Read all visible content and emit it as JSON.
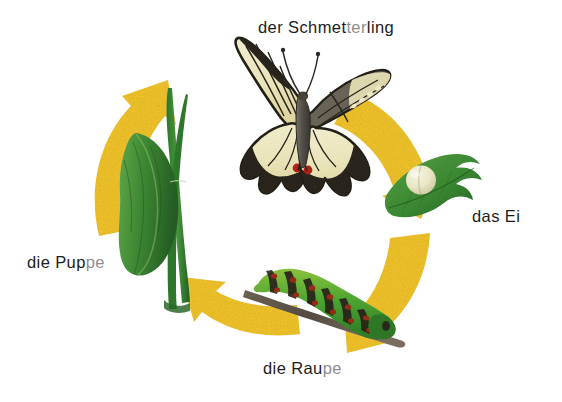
{
  "figure": {
    "title_text": "Schmetterling Lebenszyklus (Butterfly life cycle)",
    "background_color": "#ffffff",
    "arrow_color": "#f2c52a",
    "arrow_color_light": "#f7da63",
    "leaf_green": "#3f8a33",
    "leaf_green_dark": "#27662a",
    "text_color": "#1c1c1c",
    "text_color_dim": "#8e8e90"
  },
  "labels": {
    "butterfly": {
      "lead": "der Schmet",
      "dim": "ter",
      "tail": "ling",
      "full": "der Schmetterling"
    },
    "egg": {
      "lead": "das Ei",
      "dim": "",
      "tail": "",
      "full": "das Ei"
    },
    "pupa": {
      "lead": "die Pup",
      "dim": "pe",
      "tail": "",
      "full": "die Puppe"
    },
    "larva": {
      "lead": "die Rau",
      "dim": "pe",
      "tail": "",
      "full": "die Raupe"
    }
  },
  "stages": [
    {
      "id": "butterfly",
      "name": "der Schmetterling",
      "position": "top",
      "subject": "swallowtail-butterfly"
    },
    {
      "id": "egg",
      "name": "das Ei",
      "position": "right",
      "subject": "egg-on-leaf"
    },
    {
      "id": "larva",
      "name": "die Raupe",
      "position": "bottom",
      "subject": "caterpillar-on-twig"
    },
    {
      "id": "pupa",
      "name": "die Puppe",
      "position": "left",
      "subject": "chrysalis-on-grass"
    }
  ],
  "cycle": {
    "direction": "clockwise",
    "arrow_count": 4,
    "arrow_labels": [
      "arrow-top-left",
      "arrow-top-right",
      "arrow-bottom-right",
      "arrow-bottom-left"
    ]
  }
}
